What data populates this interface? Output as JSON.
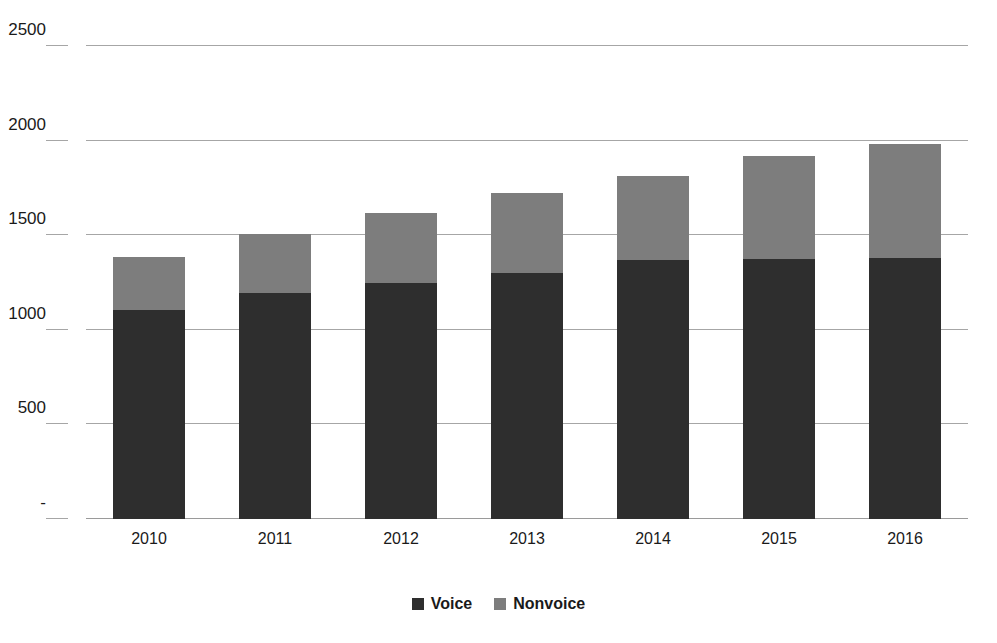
{
  "chart_data": {
    "type": "bar",
    "subtype": "stacked-column",
    "title": "",
    "subtitle": "",
    "xlabel": "",
    "ylabel": "",
    "categories": [
      "2010",
      "2011",
      "2012",
      "2013",
      "2014",
      "2015",
      "2016"
    ],
    "series": [
      {
        "name": "Voice",
        "color": "#2e2e2e",
        "values": [
          1105,
          1195,
          1250,
          1300,
          1370,
          1375,
          1380
        ]
      },
      {
        "name": "Nonvoice",
        "color": "#7d7d7d",
        "values": [
          280,
          310,
          365,
          425,
          445,
          545,
          600
        ]
      }
    ],
    "totals": [
      1385,
      1505,
      1615,
      1725,
      1815,
      1920,
      1980
    ],
    "ylim": [
      0,
      2500
    ],
    "ytick_values": [
      2500,
      2000,
      1500,
      1000,
      500,
      0
    ],
    "ytick_labels": [
      "2500",
      "2000",
      "1500",
      "1000",
      "500",
      "-"
    ],
    "grid": true,
    "grid_axis": "y",
    "legend_position": "bottom",
    "legend": [
      {
        "label": "Voice",
        "color": "#2e2e2e",
        "swatch": "square-swatch-dark"
      },
      {
        "label": "Nonvoice",
        "color": "#7d7d7d",
        "swatch": "square-swatch-gray"
      }
    ]
  },
  "colors": {
    "background": "#ffffff",
    "gridline": "#a6a6a6",
    "text": "#1a1a1a",
    "voice": "#2e2e2e",
    "nonvoice": "#7d7d7d"
  }
}
